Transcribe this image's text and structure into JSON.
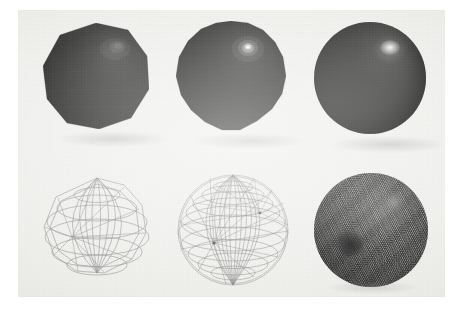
{
  "figure": {
    "domain": "scanned-figure-plate",
    "caption": "",
    "background_color": "#efefec",
    "page_color": "#ffffff",
    "plate": {
      "x": 18,
      "y": 10,
      "width": 427,
      "height": 287
    },
    "grid": {
      "rows": 2,
      "columns": 3,
      "total_panels": 6
    },
    "row_labels": [
      "shaded-spheres",
      "wireframe-spheres"
    ]
  },
  "palette": {
    "sphere_dark": "#1b1b19",
    "sphere_mid": "#2e2e2c",
    "sphere_light": "#4a4a48",
    "specular": "#ffffff",
    "wire_line": "#8a8a88",
    "wire_line_dense": "#3a3a38",
    "plate_bg": "#efefec",
    "page_bg": "#ffffff",
    "dense_disc": "#3e3e3c"
  },
  "panels": [
    {
      "id": "panel-1",
      "name": "shaded-sphere-coarse",
      "row": 1,
      "column": 1,
      "render_mode": "shaded",
      "label": "",
      "tessellation": {
        "longitude_segments": 10,
        "latitude_segments": 8,
        "faces": 80
      },
      "faceted": true,
      "center": {
        "x": 96,
        "y": 76
      },
      "radius": 53,
      "specular": {
        "x": 70,
        "y": 26,
        "radius": 13,
        "intensity": 0.3
      },
      "description": "Low-polygon faceted sphere, flat-shaded, visible polygonal silhouette"
    },
    {
      "id": "panel-2",
      "name": "shaded-sphere-medium",
      "row": 1,
      "column": 2,
      "render_mode": "shaded",
      "label": "",
      "tessellation": {
        "longitude_segments": 20,
        "latitude_segments": 16,
        "faces": 320
      },
      "faceted": true,
      "center": {
        "x": 231,
        "y": 76
      },
      "radius": 55,
      "specular": {
        "x": 72,
        "y": 27,
        "radius": 10,
        "intensity": 0.78
      },
      "description": "Medium-density sphere, near-circular silhouette with small specular highlight"
    },
    {
      "id": "panel-3",
      "name": "shaded-sphere-fine",
      "row": 1,
      "column": 3,
      "render_mode": "shaded",
      "label": "",
      "tessellation": {
        "longitude_segments": 48,
        "latitude_segments": 40,
        "faces": 1920
      },
      "faceted": false,
      "center": {
        "x": 370,
        "y": 78
      },
      "radius": 56,
      "specular": {
        "x": 74,
        "y": 26,
        "radius": 14,
        "intensity": 1.0
      },
      "description": "High-density sphere, smooth circular silhouette with broad bright specular highlight"
    },
    {
      "id": "panel-4",
      "name": "wireframe-sphere-coarse",
      "row": 2,
      "column": 1,
      "render_mode": "wireframe",
      "label": "",
      "tessellation": {
        "longitude_segments": 10,
        "latitude_segments": 8,
        "faces": 80
      },
      "center": {
        "x": 96,
        "y": 228
      },
      "radius": 53,
      "line_color": "#8a8a88",
      "line_width": 0.6,
      "description": "Coarse wireframe sphere, individual quad faces clearly separable"
    },
    {
      "id": "panel-5",
      "name": "wireframe-sphere-medium",
      "row": 2,
      "column": 2,
      "render_mode": "wireframe",
      "label": "",
      "tessellation": {
        "longitude_segments": 20,
        "latitude_segments": 16,
        "faces": 320
      },
      "center": {
        "x": 231,
        "y": 228
      },
      "radius": 55,
      "line_color": "#7e7e7c",
      "line_width": 0.5,
      "description": "Medium wireframe sphere, mesh lines converge at two visible poles"
    },
    {
      "id": "panel-6",
      "name": "wireframe-sphere-fine",
      "row": 2,
      "column": 3,
      "render_mode": "wireframe",
      "label": "",
      "tessellation": {
        "longitude_segments": 96,
        "latitude_segments": 80,
        "faces": 7680
      },
      "center": {
        "x": 370,
        "y": 228
      },
      "radius": 56,
      "line_color": "#3a3a38",
      "line_width": 0.35,
      "description": "Very dense wireframe sphere, appears as a dark disc with moire interference and dark pole clusters"
    }
  ]
}
